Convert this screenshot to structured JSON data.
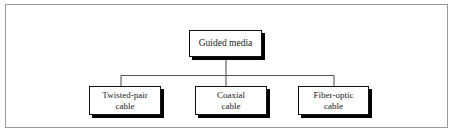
{
  "figure": {
    "background_color": "#ffffff",
    "frame_color": "#9a9a9a",
    "node_border_color": "#111111",
    "node_fill_color": "#ffffff",
    "shadow_color": "#000000",
    "connector_color": "#555555"
  },
  "diagram_data": {
    "type": "tree",
    "orientation": "top-down",
    "root": {
      "id": "guided-media",
      "label": "Guided media"
    },
    "children": [
      {
        "id": "twisted-pair-cable",
        "label": "Twisted-pair\ncable",
        "line1": "Twisted-pair",
        "line2": "cable"
      },
      {
        "id": "coaxial-cable",
        "label": "Coaxial\ncable",
        "line1": "Coaxial",
        "line2": "cable"
      },
      {
        "id": "fiber-optic-cable",
        "label": "Fiber-optic\ncable",
        "line1": "Fiber-optic",
        "line2": "cable"
      }
    ],
    "edges": [
      {
        "from": "guided-media",
        "to": "twisted-pair-cable"
      },
      {
        "from": "guided-media",
        "to": "coaxial-cable"
      },
      {
        "from": "guided-media",
        "to": "fiber-optic-cable"
      }
    ]
  }
}
